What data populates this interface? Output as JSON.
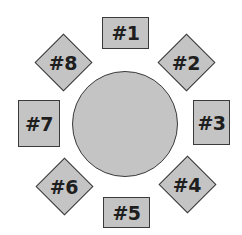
{
  "diagram": {
    "title": "",
    "table": {
      "shape": "circle",
      "cx": 125,
      "cy": 124,
      "r": 53
    },
    "colors": {
      "fill": "#c4c4c4",
      "stroke": "#3a3a3a",
      "text": "#1e1e1e",
      "background": "#ffffff"
    },
    "seats": [
      {
        "label": "#1",
        "shape": "square",
        "x": 102,
        "y": 17,
        "w": 47,
        "h": 32
      },
      {
        "label": "#2",
        "shape": "diamond",
        "cx": 186,
        "cy": 62,
        "size": 41
      },
      {
        "label": "#3",
        "shape": "square",
        "x": 193,
        "y": 100,
        "w": 37,
        "h": 45
      },
      {
        "label": "#4",
        "shape": "diamond",
        "cx": 187,
        "cy": 184,
        "size": 41
      },
      {
        "label": "#5",
        "shape": "square",
        "x": 103,
        "y": 197,
        "w": 47,
        "h": 31
      },
      {
        "label": "#6",
        "shape": "diamond",
        "cx": 64,
        "cy": 186,
        "size": 41
      },
      {
        "label": "#7",
        "shape": "square",
        "x": 18,
        "y": 100,
        "w": 42,
        "h": 47
      },
      {
        "label": "#8",
        "shape": "diamond",
        "cx": 63,
        "cy": 62,
        "size": 41
      }
    ]
  }
}
